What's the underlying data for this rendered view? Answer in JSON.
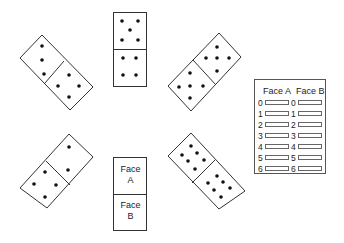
{
  "dominoes": [
    {
      "id": "top-left",
      "half_a_pips": 3,
      "half_b_pips": 4,
      "orientation": "diagonal"
    },
    {
      "id": "top-center",
      "half_a_pips": 5,
      "half_b_pips": 4,
      "orientation": "vertical"
    },
    {
      "id": "top-right",
      "half_a_pips": 5,
      "half_b_pips": 5,
      "orientation": "diagonal"
    },
    {
      "id": "bottom-left",
      "half_a_pips": 2,
      "half_b_pips": 4,
      "orientation": "diagonal"
    },
    {
      "id": "bottom-center",
      "half_a_label_line1": "Face",
      "half_a_label_line2": "A",
      "half_b_label_line1": "Face",
      "half_b_label_line2": "B",
      "orientation": "vertical"
    },
    {
      "id": "bottom-right",
      "half_a_pips": 6,
      "half_b_pips": 6,
      "orientation": "diagonal"
    }
  ],
  "tally_table": {
    "header_a": "Face A",
    "header_b": "Face B",
    "rows": [
      "0",
      "1",
      "2",
      "3",
      "4",
      "5",
      "6"
    ]
  },
  "colors": {
    "stroke": "#333333",
    "pip": "#111111",
    "background": "#ffffff"
  }
}
